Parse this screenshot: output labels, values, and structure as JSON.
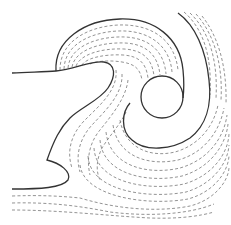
{
  "diagram": {
    "colors": {
      "background": "#ffffff",
      "solid_stroke": "#333333",
      "dashed_stroke": "#777777"
    },
    "elements": {
      "circle_obstacle": {
        "cx": 162,
        "cy": 97,
        "r": 21
      },
      "solid_curves": 4,
      "dashed_streamline_regions": 4
    }
  }
}
